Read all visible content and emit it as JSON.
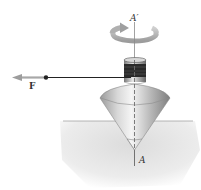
{
  "figure": {
    "labels": {
      "axis_top": "A′",
      "axis_bottom": "A",
      "force": "F"
    },
    "colors": {
      "background": "#ffffff",
      "ground": "#e4e4e4",
      "ground_line": "#9a9a9a",
      "cone_light": "#f2f2f2",
      "cone_dark": "#8f8f8f",
      "spool_dark": "#2a2a2a",
      "arrow": "#b5b5b5",
      "string": "#222222"
    }
  }
}
